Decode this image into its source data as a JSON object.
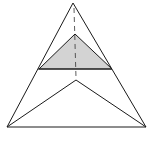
{
  "diagram": {
    "width": 155,
    "height": 142,
    "background": "#ffffff",
    "stroke_color": "#1a1a1a",
    "fill_color": "#d3d3d3",
    "outer_triangle": {
      "apex": [
        73,
        3
      ],
      "left": [
        7,
        127
      ],
      "right": [
        146,
        127
      ]
    },
    "shaded_triangle": {
      "apex": [
        75,
        34
      ],
      "left": [
        39,
        69
      ],
      "right": [
        112,
        69
      ]
    },
    "inner_apex": [
      76,
      80
    ],
    "dashed_axis": {
      "top": [
        74,
        8
      ],
      "bottom": [
        76,
        78
      ]
    }
  }
}
